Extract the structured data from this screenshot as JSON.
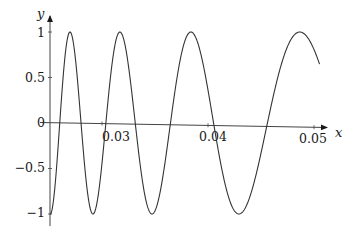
{
  "chart_data": {
    "type": "line",
    "title": "",
    "xlabel": "x",
    "ylabel": "y",
    "xlim": [
      0.0252,
      0.0555
    ],
    "ylim": [
      -1.1,
      1.1
    ],
    "grid": false,
    "legend": null,
    "x_ticks": [
      {
        "value": 0.03,
        "label": "0.03"
      },
      {
        "value": 0.04,
        "label": "0.04"
      },
      {
        "value": 0.05,
        "label": "0.05"
      }
    ],
    "y_ticks": [
      {
        "value": 1,
        "label": "1"
      },
      {
        "value": 0.5,
        "label": "0.5"
      },
      {
        "value": 0,
        "label": "0"
      },
      {
        "value": -0.5,
        "label": "−0.5"
      },
      {
        "value": -1,
        "label": "−1"
      }
    ],
    "series": [
      {
        "name": "y(x)",
        "description": "chirp-like oscillation with decreasing frequency, y = -cos(pi*(39.7 - 1/x)/2.74)",
        "color": "#333333",
        "extrema": [
          {
            "x": 0.0252,
            "y": -1
          },
          {
            "x": 0.027,
            "y": 1
          },
          {
            "x": 0.0288,
            "y": -1
          },
          {
            "x": 0.0314,
            "y": 1
          },
          {
            "x": 0.0341,
            "y": -1
          },
          {
            "x": 0.038,
            "y": 1
          },
          {
            "x": 0.0423,
            "y": -1
          },
          {
            "x": 0.0487,
            "y": 1
          }
        ],
        "end_point": {
          "x": 0.0506,
          "y": 0.65
        },
        "x": [
          0.0252,
          0.026,
          0.027,
          0.028,
          0.029,
          0.03,
          0.031,
          0.032,
          0.033,
          0.034,
          0.035,
          0.036,
          0.037,
          0.038,
          0.039,
          0.04,
          0.041,
          0.042,
          0.043,
          0.044,
          0.045,
          0.046,
          0.047,
          0.048,
          0.049,
          0.05,
          0.0506
        ],
        "values": [
          -1.0,
          0.25,
          1.0,
          -0.45,
          -0.88,
          0.55,
          0.98,
          0.27,
          -0.71,
          -1.0,
          -0.62,
          0.15,
          0.78,
          1.0,
          0.8,
          0.33,
          -0.22,
          -0.7,
          -0.98,
          -0.97,
          -0.71,
          -0.3,
          0.15,
          0.56,
          0.88,
          0.83,
          0.65
        ]
      }
    ],
    "model": {
      "c": 39.7,
      "period_in_inv_x": 2.74,
      "x_start": 0.02517,
      "x_end": 0.0506
    }
  },
  "axes": {
    "x_label": "x",
    "y_label": "y"
  }
}
